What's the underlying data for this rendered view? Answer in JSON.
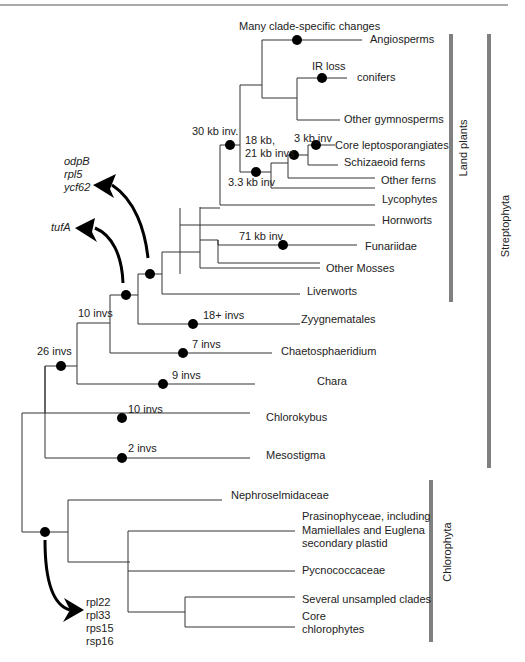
{
  "figure": {
    "taxa": {
      "angiosperms": "Angiosperms",
      "conifers": "conifers",
      "other_gymnosperms": "Other gymnosperms",
      "core_leptosporangiates": "Core leptosporangiates",
      "schizaeoid_ferns": "Schizaeoid ferns",
      "other_ferns": "Other ferns",
      "lycophytes": "Lycophytes",
      "hornworts": "Hornworts",
      "funariidae": "Funariidae",
      "other_mosses": "Other Mosses",
      "liverworts": "Liverworts",
      "zygnematales": "Zyygnematales",
      "chaetosphaeridium": "Chaetosphaeridium",
      "chara": "Chara",
      "chlorokybus": "Chlorokybus",
      "mesostigma": "Mesostigma",
      "nephroselmidaceae": "Nephroselmidaceae",
      "prasinophyceae_1": "Prasinophyceae, including",
      "prasinophyceae_2": "Mamiellales and Euglena",
      "prasinophyceae_3": "secondary plastid",
      "pycnococcaceae": "Pycnococcaceae",
      "unsampled": "Several unsampled clades",
      "core_chloro_1": "Core",
      "core_chloro_2": "chlorophytes"
    },
    "events": {
      "many_clade": "Many clade-specific changes",
      "ir_loss": "IR loss",
      "kb30": "30 kb inv.",
      "kb18_1": "18 kb,",
      "kb18_2": "21 kb invs",
      "kb3": "3 kb inv",
      "kb33": "3.3 kb inv",
      "kb71": "71 kb inv",
      "inv18": "18+ invs",
      "inv10a": "10 invs",
      "inv7": "7 invs",
      "inv26": "26 invs",
      "inv9": "9 invs",
      "inv10b": "10 invs",
      "inv2": "2 invs"
    },
    "gene_losses": {
      "group1": [
        "odpB",
        "rpl5",
        "ycf62"
      ],
      "group2": [
        "tufA"
      ],
      "group3": [
        "rpl22",
        "rpl33",
        "rps15",
        "rsp16"
      ]
    },
    "clades": {
      "land_plants": "Land plants",
      "streptophyta": "Streptophyta",
      "chlorophyta": "Chlorophyta"
    },
    "colors": {
      "branch": "#333333",
      "dot": "#000000",
      "clade_bar": "#808080",
      "arrow": "#000000"
    }
  }
}
